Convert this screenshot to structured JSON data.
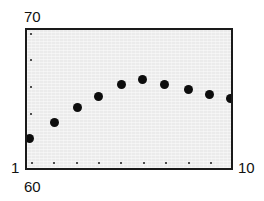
{
  "chart_data": {
    "type": "scatter",
    "title": "",
    "subtitle": "",
    "xlabel": "",
    "ylabel": "",
    "grid": false,
    "legend": null,
    "xlim": [
      1,
      10
    ],
    "ylim": [
      60,
      70
    ],
    "x_tick_labels": [
      "1",
      "10"
    ],
    "y_tick_labels": [
      "60",
      "70"
    ],
    "corner_labels": {
      "y_max": "70",
      "y_min": "1",
      "x_min": "60",
      "x_max": "10"
    },
    "x_tick_count": 9,
    "y_tick_count": 5,
    "series": [
      {
        "name": "series-1",
        "marker": "filled-circle",
        "color": "#0d0d0d",
        "x": [
          1,
          2,
          3,
          4,
          5,
          6,
          7,
          8,
          9,
          10
        ],
        "values": [
          61.5,
          64.4,
          65.8,
          66.6,
          67.2,
          67.6,
          67.3,
          66.9,
          66.6,
          66.3
        ],
        "points": [
          {
            "x": 1,
            "y": 61.5,
            "px": 27,
            "py": 136
          },
          {
            "x": 2,
            "y": 64.4,
            "px": 52,
            "py": 120
          },
          {
            "x": 3,
            "y": 65.8,
            "px": 75,
            "py": 105
          },
          {
            "x": 4,
            "y": 66.6,
            "px": 96,
            "py": 94
          },
          {
            "x": 5,
            "y": 67.2,
            "px": 119,
            "py": 82
          },
          {
            "x": 6,
            "y": 67.6,
            "px": 140,
            "py": 77
          },
          {
            "x": 7,
            "y": 67.3,
            "px": 162,
            "py": 82
          },
          {
            "x": 8,
            "y": 66.9,
            "px": 186,
            "py": 87
          },
          {
            "x": 9,
            "y": 66.6,
            "px": 207,
            "py": 92
          },
          {
            "x": 10,
            "y": 66.3,
            "px": 228,
            "py": 96
          }
        ]
      }
    ],
    "x_tick_positions_px": [
      30,
      52,
      75,
      97,
      119,
      142,
      164,
      187,
      209
    ],
    "y_tick_positions_px": [
      32,
      58,
      85,
      112,
      139
    ],
    "colors": {
      "marker": "#0d0d0d",
      "frame": "#1a1a1a",
      "plot_background": "#ebebeb",
      "page_background": "#ffffff",
      "text": "#111111"
    }
  }
}
